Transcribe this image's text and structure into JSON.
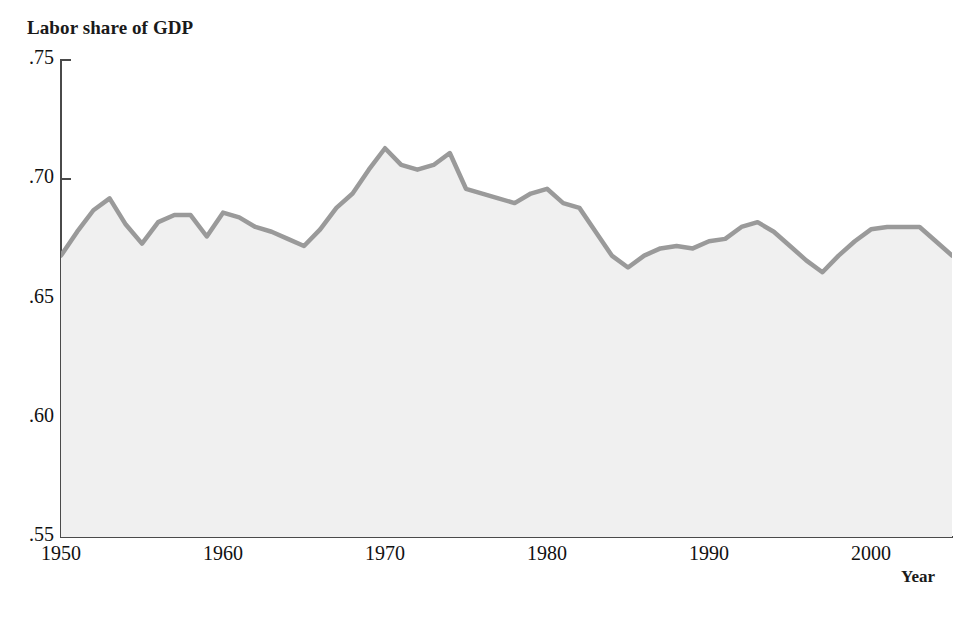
{
  "chart_data": {
    "type": "area",
    "title": "",
    "ylabel": "Labor share of GDP",
    "xlabel": "Year",
    "xlim": [
      1950,
      2005
    ],
    "ylim": [
      0.55,
      0.75
    ],
    "grid": false,
    "legend": "none",
    "y_tick_labels": [
      ".75",
      ".70",
      ".65",
      ".60",
      ".55"
    ],
    "y_tick_values": [
      0.75,
      0.7,
      0.65,
      0.6,
      0.55
    ],
    "x_tick_labels": [
      "1950",
      "1960",
      "1970",
      "1980",
      "1990",
      "2000"
    ],
    "x_tick_values": [
      1950,
      1960,
      1970,
      1980,
      1990,
      2000
    ],
    "series": [
      {
        "name": "Labor share of GDP",
        "line_color": "#9a9a9a",
        "fill_color": "#f0f0f0",
        "x": [
          1950,
          1951,
          1952,
          1953,
          1954,
          1955,
          1956,
          1957,
          1958,
          1959,
          1960,
          1961,
          1962,
          1963,
          1964,
          1965,
          1966,
          1967,
          1968,
          1969,
          1970,
          1971,
          1972,
          1973,
          1974,
          1975,
          1976,
          1977,
          1978,
          1979,
          1980,
          1981,
          1982,
          1983,
          1984,
          1985,
          1986,
          1987,
          1988,
          1989,
          1990,
          1991,
          1992,
          1993,
          1994,
          1995,
          1996,
          1997,
          1998,
          1999,
          2000,
          2001,
          2002,
          2003,
          2004,
          2005
        ],
        "y": [
          0.668,
          0.678,
          0.687,
          0.692,
          0.681,
          0.673,
          0.682,
          0.685,
          0.685,
          0.676,
          0.686,
          0.684,
          0.68,
          0.678,
          0.675,
          0.672,
          0.679,
          0.688,
          0.694,
          0.704,
          0.713,
          0.706,
          0.704,
          0.706,
          0.711,
          0.696,
          0.694,
          0.692,
          0.69,
          0.694,
          0.696,
          0.69,
          0.688,
          0.678,
          0.668,
          0.663,
          0.668,
          0.671,
          0.672,
          0.671,
          0.674,
          0.675,
          0.68,
          0.682,
          0.678,
          0.672,
          0.666,
          0.661,
          0.668,
          0.674,
          0.679,
          0.68,
          0.68,
          0.68,
          0.674,
          0.668
        ]
      }
    ]
  },
  "axes": {
    "y_title": "Labor share of GDP",
    "x_title": "Year"
  },
  "colors": {
    "line": "#9a9a9a",
    "fill": "#f0f0f0",
    "axis": "#4a4a4a",
    "text": "#111111",
    "background": "#ffffff"
  }
}
